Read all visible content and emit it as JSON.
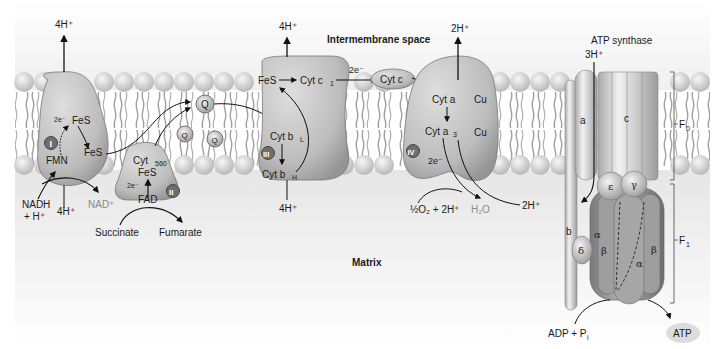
{
  "diagram": {
    "regions": {
      "intermembrane": "Intermembrane space",
      "matrix": "Matrix"
    },
    "colors": {
      "background": "#ffffff",
      "matrix_gradient": "#e9e9e9",
      "lipid_head": "#d4d4d4",
      "lipid_tail": "#9a9a9a",
      "protein": "#bdbdbd",
      "protein_dark": "#8c8c8c",
      "badge": "#6e6e6e",
      "arrow": "#111111"
    },
    "complex_I": {
      "numeral": "I",
      "labels": {
        "fes_top": "FeS",
        "fes_bottom": "FeS",
        "fmn": "FMN",
        "electrons": "2e⁻"
      },
      "proton_out": "4H⁺",
      "proton_in": "4H⁺",
      "substrate": "NADH",
      "substrate_2": "+ H⁺",
      "product": "NAD⁺"
    },
    "complex_II": {
      "numeral": "II",
      "labels": {
        "cyt": "Cyt",
        "cyt_sub": "560",
        "fes": "FeS",
        "electrons": "2e⁻",
        "fad": "FAD"
      },
      "substrate": "Succinate",
      "product": "Fumarate"
    },
    "ubiquinone": {
      "label": "Q",
      "count": 3
    },
    "complex_III": {
      "numeral": "III",
      "labels": {
        "fes": "FeS",
        "cyt_c1": "Cyt c",
        "cyt_c1_sub": "1",
        "cyt_bl": "Cyt b",
        "cyt_bl_sub": "L",
        "cyt_bh": "Cyt b",
        "cyt_bh_sub": "H"
      },
      "proton_out": "4H⁺",
      "proton_in": "4H⁺"
    },
    "cytochrome_c": {
      "label": "Cyt c",
      "electrons": "2e⁻"
    },
    "complex_IV": {
      "numeral": "IV",
      "labels": {
        "cyt_a": "Cyt a",
        "cyt_a3": "Cyt a",
        "cyt_a3_sub": "3",
        "cu_top": "Cu",
        "cu_bottom": "Cu",
        "electrons": "2e⁻"
      },
      "proton_out": "2H⁺",
      "proton_in": "2H⁺",
      "substrate": "½O₂ + 2H⁺",
      "product": "H₂O"
    },
    "atp_synthase": {
      "title": "ATP synthase",
      "proton": "3H⁺",
      "subunits": {
        "a": "a",
        "b": "b",
        "c": "c",
        "delta": "δ",
        "epsilon": "ε",
        "gamma": "γ",
        "alpha_left": "α",
        "alpha_center": "α",
        "beta_left": "β",
        "beta_right": "β"
      },
      "brackets": {
        "f0": "F",
        "f0_sub": "0",
        "f1": "F",
        "f1_sub": "1"
      },
      "substrate": "ADP + P",
      "substrate_sub": "i",
      "product": "ATP"
    }
  }
}
